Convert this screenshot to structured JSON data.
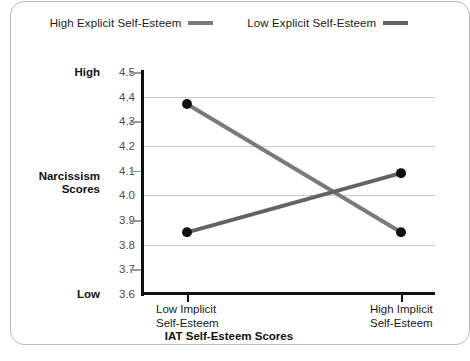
{
  "chart_data": {
    "type": "line",
    "title": "",
    "xlabel": "IAT Self-Esteem Scores",
    "ylabel": "Narcissism Scores",
    "categories": [
      "Low Implicit Self-Esteem",
      "High Implicit Self-Esteem"
    ],
    "series": [
      {
        "name": "High Explicit Self-Esteem",
        "values": [
          4.37,
          3.85
        ],
        "color": "#7a7a7a"
      },
      {
        "name": "Low Explicit Self-Esteem",
        "values": [
          3.85,
          4.09
        ],
        "color": "#636363"
      }
    ],
    "ylim": [
      3.6,
      4.5
    ],
    "yticks": [
      "3.6",
      "3.7",
      "3.8",
      "3.9",
      "4.0",
      "4.1",
      "4.2",
      "4.3",
      "4.4",
      "4.5"
    ],
    "ytick_values": [
      3.6,
      3.7,
      3.8,
      3.9,
      4.0,
      4.1,
      4.2,
      4.3,
      4.4,
      4.5
    ],
    "gridline_values": [
      3.8,
      4.0,
      4.2,
      4.4
    ],
    "tickmark_values": [
      3.7,
      3.9,
      4.1,
      4.3,
      4.5
    ],
    "y_anchors": [
      {
        "label": "High",
        "value": 4.5
      },
      {
        "label": "Low",
        "value": 3.6
      }
    ],
    "grid": true,
    "legend_position": "top",
    "marker": "filled-circle",
    "marker_color": "#111111"
  },
  "legend": {
    "entries": [
      {
        "label": "High Explicit Self-Esteem",
        "color": "#7a7a7a"
      },
      {
        "label": "Low Explicit Self-Esteem",
        "color": "#636363"
      }
    ]
  },
  "axes": {
    "y_title_line1": "Narcissism",
    "y_title_line2": "Scores",
    "x_title": "IAT Self-Esteem Scores",
    "x_labels": [
      {
        "line1": "Low Implicit",
        "line2": "Self-Esteem"
      },
      {
        "line1": "High Implicit",
        "line2": "Self-Esteem"
      }
    ]
  },
  "colors": {
    "grid": "#c9c9c9",
    "axis": "#111111",
    "tick_text": "#4c4c4c",
    "frame": "#b9b9b9"
  }
}
